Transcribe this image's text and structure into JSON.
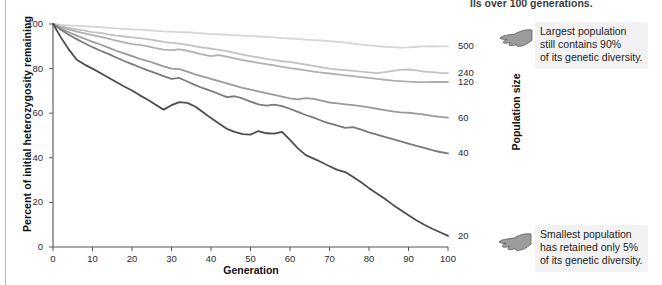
{
  "figure": {
    "clipped_heading": "lls over 100 generations.",
    "callouts": [
      {
        "name": "largest-population-callout",
        "icon": "pointing-hand-icon",
        "lines": [
          "Largest population",
          "still contains 90%",
          "of its genetic diversity."
        ]
      },
      {
        "name": "smallest-population-callout",
        "icon": "pointing-hand-icon",
        "lines": [
          "Smallest population",
          "has retained only 5%",
          "of its genetic diversity."
        ]
      }
    ],
    "population_size_label": "Population size"
  },
  "chart_data": {
    "type": "line",
    "title": "",
    "xlabel": "Generation",
    "ylabel": "Percent of initial heterozygosity remaining",
    "xlim": [
      0,
      100
    ],
    "ylim": [
      0,
      100
    ],
    "xticks": [
      0,
      10,
      20,
      30,
      40,
      50,
      60,
      70,
      80,
      90,
      100
    ],
    "yticks": [
      0,
      20,
      40,
      60,
      80,
      100
    ],
    "grid": false,
    "legend_position": "right-endpoint-labels",
    "legend_title": "Population size",
    "x": [
      0,
      2,
      4,
      6,
      8,
      10,
      12,
      14,
      16,
      18,
      20,
      22,
      24,
      26,
      28,
      30,
      32,
      34,
      36,
      38,
      40,
      42,
      44,
      46,
      48,
      50,
      52,
      54,
      56,
      58,
      60,
      62,
      64,
      66,
      68,
      70,
      72,
      74,
      76,
      78,
      80,
      82,
      84,
      86,
      88,
      90,
      92,
      94,
      96,
      98,
      100
    ],
    "series": [
      {
        "name": "500",
        "label": "500",
        "color": "#d5d5d5",
        "values": [
          100,
          99.6,
          99.4,
          99.2,
          99.0,
          98.8,
          98.6,
          98.3,
          98.0,
          97.8,
          97.6,
          97.5,
          97.2,
          96.9,
          96.7,
          96.6,
          96.4,
          96.3,
          96.0,
          95.8,
          95.5,
          95.4,
          95.2,
          95.0,
          94.8,
          94.6,
          94.4,
          94.2,
          94.0,
          93.7,
          93.5,
          93.3,
          93.0,
          92.8,
          92.6,
          92.3,
          92.0,
          91.6,
          91.2,
          90.8,
          90.4,
          90.1,
          89.8,
          89.6,
          89.4,
          89.5,
          89.8,
          90.0,
          90.1,
          90.0,
          90.0
        ]
      },
      {
        "name": "240",
        "label": "240",
        "color": "#c2c2c2",
        "values": [
          100,
          99.0,
          98.3,
          97.6,
          97.0,
          96.4,
          96.0,
          95.3,
          94.8,
          94.4,
          94.0,
          93.7,
          93.2,
          92.6,
          92.0,
          91.5,
          91.2,
          90.6,
          90.0,
          89.4,
          89.0,
          88.4,
          87.8,
          87.0,
          86.3,
          85.6,
          85.0,
          84.4,
          83.8,
          83.3,
          83.0,
          82.4,
          81.8,
          81.2,
          80.6,
          80.0,
          79.6,
          79.3,
          79.0,
          78.6,
          78.3,
          78.0,
          78.4,
          79.0,
          79.4,
          79.6,
          79.2,
          78.6,
          78.4,
          78.1,
          78.0
        ]
      },
      {
        "name": "120",
        "label": "120",
        "color": "#b0b0b0",
        "values": [
          100,
          98.6,
          97.6,
          96.6,
          95.8,
          95.0,
          94.2,
          93.4,
          92.5,
          91.8,
          91.0,
          90.6,
          90.0,
          89.2,
          88.5,
          88.3,
          88.6,
          88.0,
          87.2,
          86.3,
          85.6,
          86.0,
          85.4,
          84.6,
          83.8,
          83.2,
          82.6,
          82.0,
          81.4,
          80.8,
          80.2,
          79.8,
          79.2,
          78.6,
          78.2,
          77.8,
          77.4,
          77.0,
          76.6,
          76.2,
          75.8,
          75.4,
          75.0,
          74.6,
          74.4,
          74.2,
          74.0,
          73.9,
          74.0,
          74.0,
          74.0
        ]
      },
      {
        "name": "60",
        "label": "60",
        "color": "#9a9a9a",
        "values": [
          100,
          98.0,
          96.3,
          94.8,
          93.4,
          92.0,
          90.8,
          89.4,
          88.0,
          86.8,
          85.6,
          84.4,
          83.4,
          82.2,
          81.0,
          80.0,
          79.8,
          78.6,
          77.4,
          76.4,
          75.4,
          74.4,
          73.4,
          72.4,
          71.4,
          70.6,
          69.8,
          69.0,
          68.2,
          67.4,
          66.6,
          66.2,
          66.8,
          66.4,
          65.6,
          64.8,
          64.4,
          64.0,
          63.6,
          63.2,
          62.6,
          62.0,
          61.4,
          60.8,
          60.4,
          60.2,
          59.8,
          59.4,
          58.8,
          58.4,
          58.0
        ]
      },
      {
        "name": "40",
        "label": "40",
        "color": "#7a7a7a",
        "values": [
          100,
          97.4,
          95.2,
          93.2,
          91.4,
          89.6,
          88.0,
          86.6,
          85.0,
          83.4,
          82.0,
          80.6,
          79.2,
          78.0,
          76.6,
          75.4,
          75.8,
          74.2,
          72.6,
          71.2,
          70.0,
          68.6,
          67.2,
          67.6,
          66.6,
          65.2,
          64.0,
          63.4,
          63.8,
          63.2,
          62.0,
          60.6,
          59.2,
          58.0,
          56.6,
          55.4,
          54.4,
          53.4,
          53.8,
          52.6,
          51.4,
          50.4,
          49.4,
          48.4,
          47.4,
          46.4,
          45.4,
          44.4,
          43.4,
          42.6,
          42.0
        ]
      },
      {
        "name": "20",
        "label": "20",
        "color": "#4d4d4d",
        "values": [
          100,
          94.0,
          88.6,
          84.0,
          81.8,
          80.0,
          78.0,
          76.0,
          74.0,
          72.0,
          70.2,
          68.0,
          66.0,
          63.8,
          61.6,
          63.6,
          65.0,
          64.6,
          63.0,
          60.4,
          57.8,
          55.4,
          53.0,
          51.6,
          50.6,
          50.4,
          52.0,
          51.0,
          50.8,
          51.6,
          48.0,
          44.2,
          41.2,
          39.6,
          38.0,
          36.2,
          34.6,
          33.6,
          31.4,
          29.0,
          26.4,
          24.0,
          21.6,
          19.0,
          16.6,
          14.2,
          12.0,
          10.0,
          8.2,
          6.6,
          5.0
        ]
      }
    ],
    "endpoint_labels": [
      {
        "label": "500",
        "y": 90
      },
      {
        "label": "240",
        "y": 78
      },
      {
        "label": "120",
        "y": 74
      },
      {
        "label": "60",
        "y": 58
      },
      {
        "label": "40",
        "y": 42
      },
      {
        "label": "20",
        "y": 5
      }
    ]
  }
}
